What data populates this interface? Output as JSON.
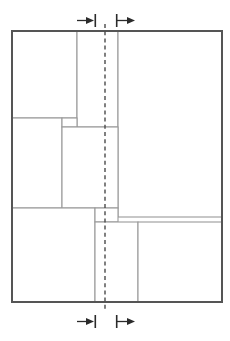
{
  "diagram": {
    "type": "partition-schematic",
    "canvas": {
      "width": 230,
      "height": 341
    },
    "colors": {
      "outer_border": "#555555",
      "partition_line": "#9a9a9a",
      "centerline": "#4a4a4a",
      "marker": "#2b2b2b",
      "background": "#ffffff"
    },
    "outer_frame": {
      "x": 12,
      "y": 31,
      "width": 210,
      "height": 271
    },
    "centerline": {
      "x": 105,
      "y_top": 24,
      "y_bottom": 309,
      "style": "dashed"
    },
    "cells": [
      {
        "id": "cell-top-left",
        "label": "A",
        "x": 12,
        "y": 31,
        "width": 65,
        "height": 87
      },
      {
        "id": "cell-top-middle",
        "label": "B",
        "x": 77,
        "y": 31,
        "width": 41,
        "height": 96
      },
      {
        "id": "cell-right-large",
        "label": "C",
        "x": 118,
        "y": 31,
        "width": 104,
        "height": 186
      },
      {
        "id": "cell-mid-left",
        "label": "D",
        "x": 12,
        "y": 118,
        "width": 50,
        "height": 90
      },
      {
        "id": "cell-mid-notch",
        "label": "E",
        "x": 62,
        "y": 118,
        "width": 15,
        "height": 9
      },
      {
        "id": "cell-mid-middle",
        "label": "F",
        "x": 62,
        "y": 127,
        "width": 56,
        "height": 81
      },
      {
        "id": "cell-bottom-left",
        "label": "G",
        "x": 12,
        "y": 208,
        "width": 83,
        "height": 94
      },
      {
        "id": "cell-bottom-notch",
        "label": "H",
        "x": 95,
        "y": 208,
        "width": 23,
        "height": 14
      },
      {
        "id": "cell-bottom-middle",
        "label": "I",
        "x": 95,
        "y": 222,
        "width": 43,
        "height": 80
      },
      {
        "id": "cell-bottom-right",
        "label": "J",
        "x": 138,
        "y": 222,
        "width": 84,
        "height": 80
      }
    ],
    "markers": {
      "top": [
        {
          "id": "marker-top-left",
          "direction": "right",
          "arrow_x": 82,
          "bar_x": 95,
          "y": 20,
          "glyph": "arrow-to-bar-right"
        },
        {
          "id": "marker-top-right",
          "direction": "right",
          "arrow_x": 129,
          "bar_x": 117,
          "y": 20,
          "glyph": "bar-to-arrow-right"
        }
      ],
      "bottom": [
        {
          "id": "marker-bottom-left",
          "direction": "right",
          "arrow_x": 82,
          "bar_x": 95,
          "y": 321,
          "glyph": "arrow-to-bar-right"
        },
        {
          "id": "marker-bottom-right",
          "direction": "right",
          "arrow_x": 129,
          "bar_x": 117,
          "y": 321,
          "glyph": "bar-to-arrow-right"
        }
      ]
    }
  }
}
